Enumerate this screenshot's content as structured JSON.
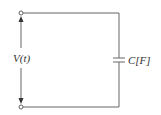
{
  "diagram": {
    "type": "circuit",
    "voltage_label": "V(t)",
    "capacitor_label": "C[F]",
    "components": [
      {
        "kind": "voltage-terminals",
        "label": "V(t)"
      },
      {
        "kind": "capacitor",
        "label": "C[F]"
      }
    ],
    "colors": {
      "wire": "#555555",
      "text": "#333333"
    }
  }
}
